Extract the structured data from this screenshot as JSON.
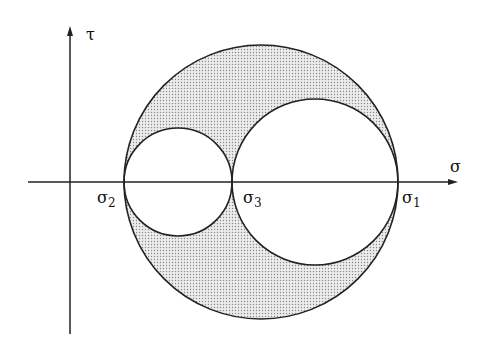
{
  "diagram": {
    "axes": {
      "x_label": "σ",
      "y_label": "τ"
    },
    "points": [
      {
        "id": "sigma2",
        "label": "σ",
        "sub": "2",
        "x": 124
      },
      {
        "id": "sigma3",
        "label": "σ",
        "sub": "3",
        "x": 232
      },
      {
        "id": "sigma1",
        "label": "σ",
        "sub": "1",
        "x": 398
      }
    ],
    "circles": [
      {
        "name": "outer-circle",
        "between": [
          "σ2",
          "σ1"
        ],
        "cx": 261,
        "r": 137
      },
      {
        "name": "small-circle",
        "between": [
          "σ2",
          "σ3"
        ],
        "cx": 178,
        "r": 54
      },
      {
        "name": "medium-circle",
        "between": [
          "σ3",
          "σ1"
        ],
        "cx": 315,
        "r": 83
      }
    ],
    "shaded_region": "area inside outer circle and outside the two inner circles",
    "colors": {
      "line": "#222222",
      "shade": "#d4d4d4"
    }
  }
}
